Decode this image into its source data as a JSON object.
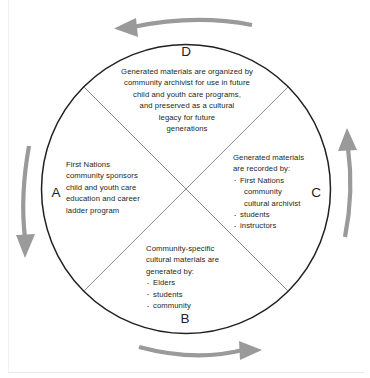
{
  "diagram": {
    "shape": "circle-quadrants",
    "colors": {
      "outline": "#231f20",
      "divider": "#6d6d6d",
      "arrow": "#9a9a9a",
      "text": "#231f20",
      "background": "#ffffff"
    },
    "quadrants": [
      {
        "id": "A",
        "label": "A",
        "position": "left",
        "align": "left",
        "lines": [
          "First Nations",
          "community sponsors",
          "child and youth care",
          "education and career",
          "ladder program"
        ],
        "bullets": []
      },
      {
        "id": "B",
        "label": "B",
        "position": "bottom",
        "align": "left",
        "lines": [
          "Community-specific",
          "cultural materials are",
          "generated by:"
        ],
        "bullets": [
          {
            "lines": [
              "Elders"
            ]
          },
          {
            "lines": [
              "students"
            ]
          },
          {
            "lines": [
              "community"
            ]
          }
        ]
      },
      {
        "id": "C",
        "label": "C",
        "position": "right",
        "align": "left",
        "lines": [
          "Generated materials",
          "are recorded by:"
        ],
        "bullets": [
          {
            "lines": [
              "First Nations",
              "community",
              "cultural archivist"
            ]
          },
          {
            "lines": [
              "students"
            ]
          },
          {
            "lines": [
              "instructors"
            ]
          }
        ]
      },
      {
        "id": "D",
        "label": "D",
        "position": "top",
        "align": "center",
        "lines": [
          "Generated materials are organized by",
          "community archivist for use in future",
          "child and youth care programs,",
          "and preserved as a cultural",
          "legacy for future",
          "generations"
        ],
        "bullets": []
      }
    ],
    "arrows": [
      {
        "id": "top",
        "name": "arrow-top-leftward",
        "direction": "left",
        "flow": "C to D"
      },
      {
        "id": "left",
        "name": "arrow-left-downward",
        "direction": "down",
        "flow": "D to A"
      },
      {
        "id": "bottom",
        "name": "arrow-bottom-rightward",
        "direction": "right",
        "flow": "A to B"
      },
      {
        "id": "right",
        "name": "arrow-right-upward",
        "direction": "up",
        "flow": "B to C"
      }
    ]
  }
}
